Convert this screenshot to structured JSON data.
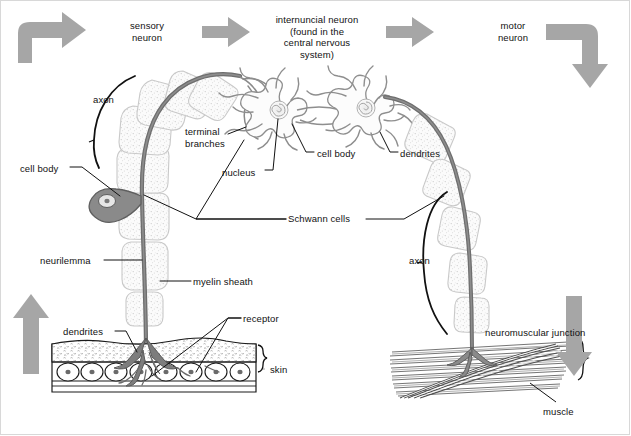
{
  "diagram": {
    "colors": {
      "arrow_gray": "#a6a6a6",
      "nerve_fiber": "#6e6e6e",
      "sheath_outline": "#c9c9c9",
      "leader_line": "#111111",
      "text": "#111111",
      "background": "#ffffff",
      "frame": "#d8d8d8"
    },
    "headings": [
      {
        "name": "sensory-neuron-heading",
        "text": "sensory\nneuron",
        "x": 112,
        "y": 20,
        "w": 70
      },
      {
        "name": "internuncial-neuron-heading",
        "text": "internuncial neuron\n(found in the\ncentral nervous\nsystem)",
        "x": 252,
        "y": 14,
        "w": 130
      },
      {
        "name": "motor-neuron-heading",
        "text": "motor\nneuron",
        "x": 478,
        "y": 20,
        "w": 70
      }
    ],
    "labels": [
      {
        "name": "axon-left-label",
        "text": "axon",
        "x": 93,
        "y": 94,
        "w": 34,
        "align": "left"
      },
      {
        "name": "terminal-branches-label",
        "text": "terminal\nbranches",
        "x": 185,
        "y": 126,
        "w": 58,
        "align": "left"
      },
      {
        "name": "cell-body-left-label",
        "text": "cell body",
        "x": 20,
        "y": 163,
        "w": 48,
        "align": "left"
      },
      {
        "name": "nucleus-label",
        "text": "nucleus",
        "x": 222,
        "y": 167,
        "w": 42,
        "align": "left"
      },
      {
        "name": "cell-body-internuncial-label",
        "text": "cell body",
        "x": 317,
        "y": 148,
        "w": 48,
        "align": "left"
      },
      {
        "name": "dendrites-internuncial-label",
        "text": "dendrites",
        "x": 400,
        "y": 148,
        "w": 50,
        "align": "left"
      },
      {
        "name": "schwann-cells-label",
        "text": "Schwann cells",
        "x": 288,
        "y": 216,
        "w": 76,
        "align": "left"
      },
      {
        "name": "neurilemma-label",
        "text": "neurilemma",
        "x": 40,
        "y": 257,
        "w": 62,
        "align": "left"
      },
      {
        "name": "myelin-sheath-label",
        "text": "myelin sheath",
        "x": 193,
        "y": 278,
        "w": 74,
        "align": "left"
      },
      {
        "name": "dendrites-skin-label",
        "text": "dendrites",
        "x": 63,
        "y": 328,
        "w": 50,
        "align": "left"
      },
      {
        "name": "receptor-label",
        "text": "receptor",
        "x": 243,
        "y": 315,
        "w": 46,
        "align": "left"
      },
      {
        "name": "skin-label",
        "text": "skin",
        "x": 266,
        "y": 366,
        "w": 26,
        "align": "left"
      },
      {
        "name": "axon-right-label",
        "text": "axon",
        "x": 409,
        "y": 257,
        "w": 34,
        "align": "left"
      },
      {
        "name": "neuromuscular-junction-label",
        "text": "neuromuscular junction",
        "x": 485,
        "y": 329,
        "w": 120,
        "align": "left"
      },
      {
        "name": "muscle-label",
        "text": "muscle",
        "x": 543,
        "y": 408,
        "w": 40,
        "align": "left"
      }
    ],
    "flow_arrows": [
      {
        "name": "arrow-skin-to-sensory",
        "type": "elbow-up-right",
        "x": 16,
        "y": 16
      },
      {
        "name": "arrow-sensory-to-internuncial",
        "type": "right",
        "x": 200,
        "y": 26
      },
      {
        "name": "arrow-internuncial-to-motor",
        "type": "right",
        "x": 385,
        "y": 26
      },
      {
        "name": "arrow-motor-down",
        "type": "elbow-right-down",
        "x": 565,
        "y": 16
      },
      {
        "name": "arrow-stimulus-up",
        "type": "up",
        "x": 16,
        "y": 292
      },
      {
        "name": "arrow-response-down",
        "type": "down",
        "x": 565,
        "y": 292
      }
    ],
    "structures": [
      {
        "name": "sensory-neuron-fiber",
        "desc": "myelinated axon arcing from skin receptor up to terminal branches"
      },
      {
        "name": "sensory-cell-body",
        "desc": "teardrop-shaped cell body on side of sensory axon"
      },
      {
        "name": "schwann-cell-segments",
        "desc": "stippled myelin sheath segments along both axons"
      },
      {
        "name": "internuncial-neuron-1",
        "desc": "star shaped cell body with many dendrites"
      },
      {
        "name": "internuncial-neuron-2",
        "desc": "star shaped cell body with many dendrites"
      },
      {
        "name": "motor-neuron-fiber",
        "desc": "myelinated axon arcing from internuncial neuron down to muscle"
      },
      {
        "name": "skin-tissue",
        "desc": "layered epidermis block with receptor endings"
      },
      {
        "name": "muscle-tissue",
        "desc": "bundle of striated muscle fibers"
      },
      {
        "name": "axon-brace-left",
        "desc": "curved brace marking sensory axon"
      },
      {
        "name": "axon-brace-right",
        "desc": "curved brace marking motor axon"
      },
      {
        "name": "skin-brace",
        "desc": "brace marking skin thickness"
      },
      {
        "name": "muscle-brace",
        "desc": "brace marking muscle thickness"
      }
    ]
  }
}
